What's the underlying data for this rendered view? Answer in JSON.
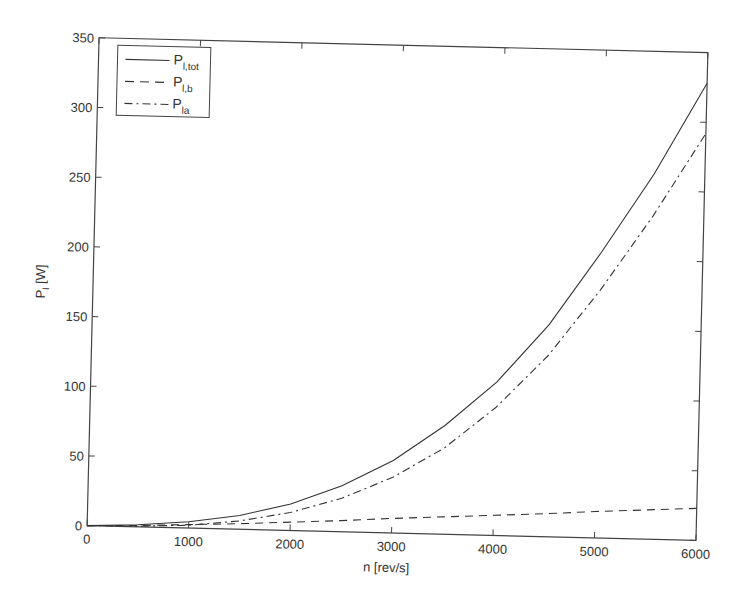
{
  "chart_data": {
    "type": "line",
    "title": "",
    "xlabel": "n [rev/s]",
    "ylabel": "P_l [W]",
    "xlim": [
      0,
      6000
    ],
    "ylim": [
      0,
      350
    ],
    "xticks": [
      0,
      1000,
      2000,
      3000,
      4000,
      5000,
      6000
    ],
    "yticks": [
      0,
      50,
      100,
      150,
      200,
      250,
      300,
      350
    ],
    "grid": false,
    "legend_position": "upper-left",
    "x": [
      0,
      500,
      1000,
      1500,
      2000,
      2500,
      3000,
      3500,
      4000,
      4500,
      5000,
      5500,
      6000
    ],
    "series": [
      {
        "name": "P_l,tot",
        "label_main": "P",
        "label_sub": "l,tot",
        "style": "solid",
        "values": [
          0,
          1.5,
          4.5,
          10,
          19,
          33,
          52,
          78,
          110,
          152,
          205,
          262,
          328
        ]
      },
      {
        "name": "P_l,b",
        "label_main": "P",
        "label_sub": "l,b",
        "style": "dashed",
        "values": [
          0,
          1,
          2.5,
          4,
          6,
          8,
          10.5,
          12.5,
          14.5,
          16.5,
          19,
          21,
          23
        ]
      },
      {
        "name": "P_la",
        "label_main": "P",
        "label_sub": "la",
        "style": "dashdot",
        "values": [
          0,
          0.5,
          2,
          6,
          13,
          24,
          40,
          62,
          92,
          130,
          178,
          232,
          292
        ]
      }
    ]
  }
}
